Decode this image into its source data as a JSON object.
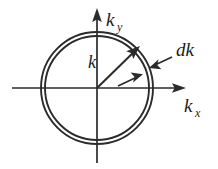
{
  "figure": {
    "background_color": "#ffffff",
    "ink_color": "#2b2b2b",
    "labels": {
      "y_axis_base": "k",
      "y_axis_subscript": "y",
      "x_axis_base": "k",
      "x_axis_subscript": "x",
      "wavevector": "k",
      "shell_thickness": "dk"
    },
    "geometry": {
      "origin_x": 97,
      "origin_y": 88,
      "outer_radius": 56,
      "inner_radius": 52,
      "x_axis_start_x": 12,
      "x_axis_end_x": 186,
      "y_axis_top_y": 8,
      "y_axis_bottom_y": 163,
      "k_vector_tip_x": 139,
      "k_vector_tip_y": 46
    },
    "elements": {
      "outer_circle": "outer-ring",
      "inner_circle": "inner-ring",
      "k_arrow": "wavevector-arrow",
      "dk_arrow_lower": "shell-pointer-lower",
      "dk_arrow_upper": "shell-pointer-upper"
    }
  }
}
